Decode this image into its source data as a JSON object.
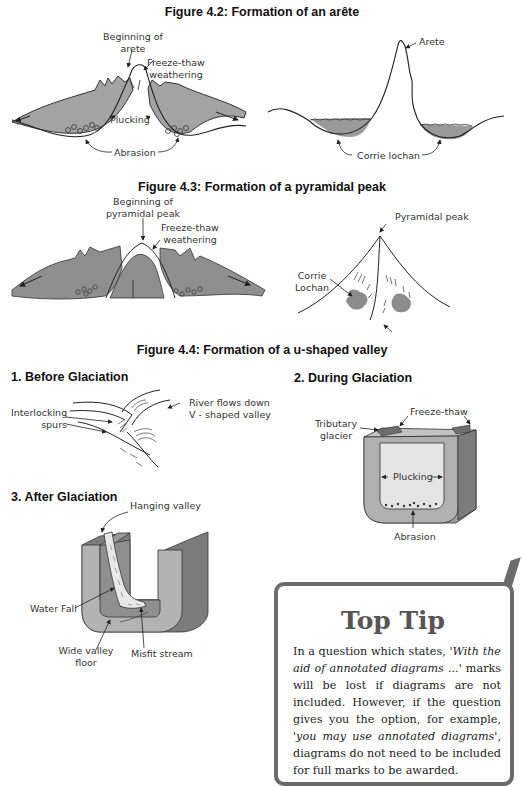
{
  "figures": {
    "fig42": {
      "title": "Figure 4.2: Formation of an arête",
      "left_labels": {
        "beginning": [
          "Beginning of",
          "arete"
        ],
        "freeze_thaw": [
          "Freeze-thaw",
          "weathering"
        ],
        "plucking": "Plucking",
        "abrasion": "Abrasion"
      },
      "right_labels": {
        "arete": "Arete",
        "corrie_lochan": "Corrie lochan"
      }
    },
    "fig43": {
      "title": "Figure 4.3: Formation of a pyramidal peak",
      "left_labels": {
        "beginning": [
          "Beginning of",
          "pyramidal peak"
        ],
        "freeze_thaw": [
          "Freeze-thaw",
          "weathering"
        ]
      },
      "right_labels": {
        "pyramidal_peak": "Pyramidal peak",
        "corrie_lochan": [
          "Corrie",
          "Lochan"
        ]
      }
    },
    "fig44": {
      "title": "Figure 4.4: Formation of a u-shaped valley",
      "before": {
        "title": "1. Before Glaciation",
        "interlocking": [
          "Interlocking",
          "spurs"
        ],
        "river": [
          "River flows down",
          "V - shaped valley"
        ]
      },
      "during": {
        "title": "2. During Glaciation",
        "tributary": [
          "Tributary",
          "glacier"
        ],
        "freeze_thaw": "Freeze-thaw",
        "plucking": "Plucking",
        "abrasion": "Abrasion"
      },
      "after": {
        "title": "3. After Glaciation",
        "hanging_valley": "Hanging valley",
        "water_fall": "Water Fall",
        "wide_floor": [
          "Wide valley",
          "floor"
        ],
        "misfit": "Misfit stream"
      }
    }
  },
  "top_tip": {
    "title": "Top Tip",
    "p1": "In a question which states, ",
    "q1": "'With the aid of annotated diagrams ...'",
    "p2": " marks will be lost if diagrams are not included. However, if the question gives you the option, for example, ",
    "q2": "'you may use annotated diagrams'",
    "p3": ", diagrams do not need to be included for full marks to be awarded."
  },
  "colors": {
    "shade_dark": "#8c8c8c",
    "shade_mid": "#a9a9a9",
    "shade_light": "#d4d4d4",
    "tip_border": "#6b6b6b",
    "check": "#6b6b6b"
  }
}
